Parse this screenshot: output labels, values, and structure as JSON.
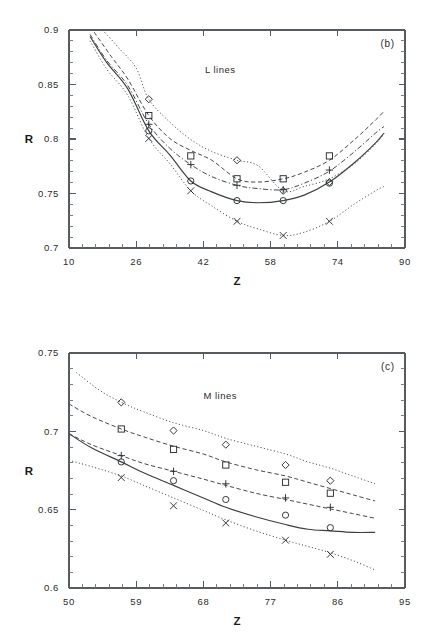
{
  "figure": {
    "background": "#ffffff",
    "ink_color": "#3a3f42"
  },
  "panels": [
    {
      "tag": "(b)",
      "annotation": "L lines",
      "xlabel": "Z",
      "ylabel": "R"
    },
    {
      "tag": "(c)",
      "annotation": "M lines",
      "xlabel": "Z",
      "ylabel": "R"
    }
  ],
  "chart_data": [
    {
      "type": "line",
      "title": "L lines",
      "panel_tag": "(b)",
      "xlabel": "Z",
      "ylabel": "R",
      "xlim": [
        10,
        90
      ],
      "ylim": [
        0.7,
        0.9
      ],
      "xticks": [
        10,
        26,
        42,
        58,
        74,
        90
      ],
      "xtick_labels": [
        "10",
        "26",
        "42",
        "58",
        "74",
        "90"
      ],
      "yticks": [
        0.7,
        0.75,
        0.8,
        0.85,
        0.9
      ],
      "ytick_labels": [
        "0.7",
        "0.75",
        "0.8",
        "0.85",
        "0.9"
      ],
      "x_minor_per_major": 4,
      "y_minor_per_major": 4,
      "grid": false,
      "legend": "none",
      "series": [
        {
          "name": "diamond-series",
          "marker": "diamond",
          "linestyle": "dotted",
          "x": [
            18,
            22,
            26,
            29,
            34,
            39,
            44,
            50,
            55,
            61,
            66,
            72,
            78,
            83,
            85
          ],
          "y": [
            0.9,
            0.883,
            0.865,
            0.8365,
            0.8155,
            0.7995,
            0.7885,
            0.7805,
            0.7755,
            0.7525,
            0.7565,
            0.7635,
            0.7775,
            0.7955,
            0.805
          ],
          "marker_x": [
            29,
            50,
            61,
            72
          ],
          "marker_y": [
            0.8365,
            0.7805,
            0.7525,
            0.7605
          ]
        },
        {
          "name": "square-series",
          "marker": "square",
          "linestyle": "dashed",
          "x": [
            16,
            20,
            24,
            29,
            34,
            39,
            44,
            50,
            55,
            61,
            66,
            72,
            78,
            83,
            85
          ],
          "y": [
            0.898,
            0.876,
            0.855,
            0.8215,
            0.8005,
            0.7895,
            0.7805,
            0.7635,
            0.7605,
            0.7635,
            0.7695,
            0.7805,
            0.7995,
            0.8175,
            0.8255
          ],
          "marker_x": [
            29,
            39,
            50,
            61,
            72
          ],
          "marker_y": [
            0.8215,
            0.7845,
            0.7635,
            0.7635,
            0.7845
          ]
        },
        {
          "name": "plus-series",
          "marker": "plus",
          "linestyle": "dashdot",
          "x": [
            15,
            19,
            24,
            29,
            34,
            39,
            44,
            50,
            55,
            61,
            66,
            72,
            78,
            83,
            85
          ],
          "y": [
            0.896,
            0.872,
            0.849,
            0.8135,
            0.7915,
            0.7765,
            0.7655,
            0.7575,
            0.7545,
            0.7535,
            0.7595,
            0.7705,
            0.7885,
            0.8055,
            0.8115
          ],
          "marker_x": [
            29,
            39,
            50,
            61,
            72
          ],
          "marker_y": [
            0.8135,
            0.7765,
            0.7575,
            0.7535,
            0.7715
          ]
        },
        {
          "name": "circle-series",
          "marker": "circle",
          "linestyle": "solid",
          "x": [
            15,
            19,
            24,
            29,
            34,
            39,
            44,
            50,
            55,
            61,
            66,
            72,
            78,
            83,
            85
          ],
          "y": [
            0.894,
            0.87,
            0.846,
            0.8075,
            0.7855,
            0.7615,
            0.7515,
            0.7435,
            0.7415,
            0.7435,
            0.7485,
            0.7605,
            0.7785,
            0.7965,
            0.8055
          ],
          "marker_x": [
            29,
            39,
            50,
            61,
            72
          ],
          "marker_y": [
            0.8075,
            0.7615,
            0.7435,
            0.7435,
            0.7595
          ]
        },
        {
          "name": "cross-series",
          "marker": "cross",
          "linestyle": "dotted",
          "x": [
            15,
            19,
            24,
            29,
            34,
            39,
            44,
            50,
            55,
            61,
            66,
            72,
            78,
            83,
            85
          ],
          "y": [
            0.89,
            0.864,
            0.84,
            0.8005,
            0.7775,
            0.7525,
            0.7385,
            0.7245,
            0.7175,
            0.7115,
            0.7145,
            0.7245,
            0.7405,
            0.7525,
            0.7565
          ],
          "marker_x": [
            29,
            39,
            50,
            61,
            72
          ],
          "marker_y": [
            0.8005,
            0.7525,
            0.7245,
            0.7115,
            0.7245
          ]
        }
      ]
    },
    {
      "type": "line",
      "title": "M lines",
      "panel_tag": "(c)",
      "xlabel": "Z",
      "ylabel": "R",
      "xlim": [
        50,
        95
      ],
      "ylim": [
        0.6,
        0.75
      ],
      "xticks": [
        50,
        59,
        68,
        77,
        86,
        95
      ],
      "xtick_labels": [
        "50",
        "59",
        "68",
        "77",
        "86",
        "95"
      ],
      "yticks": [
        0.6,
        0.65,
        0.7,
        0.75
      ],
      "ytick_labels": [
        "0.6",
        "0.65",
        "0.7",
        "0.75"
      ],
      "x_minor_per_major": 4,
      "y_minor_per_major": 4,
      "grid": false,
      "legend": "none",
      "series": [
        {
          "name": "diamond-series",
          "marker": "diamond",
          "linestyle": "dotted",
          "x": [
            51,
            54,
            57,
            60,
            64,
            68,
            71,
            75,
            79,
            82,
            85,
            88,
            91
          ],
          "y": [
            0.7375,
            0.7265,
            0.7185,
            0.7125,
            0.7055,
            0.7005,
            0.6955,
            0.6905,
            0.6855,
            0.6805,
            0.6765,
            0.6715,
            0.6665
          ],
          "marker_x": [
            57,
            64,
            71,
            79,
            85
          ],
          "marker_y": [
            0.7185,
            0.7005,
            0.6915,
            0.6785,
            0.6685
          ]
        },
        {
          "name": "square-series",
          "marker": "square",
          "linestyle": "dashed",
          "x": [
            50,
            53,
            57,
            60,
            64,
            68,
            71,
            75,
            79,
            82,
            85,
            88,
            91
          ],
          "y": [
            0.7175,
            0.7095,
            0.7015,
            0.6965,
            0.6905,
            0.6855,
            0.6805,
            0.6755,
            0.6715,
            0.6675,
            0.6635,
            0.6595,
            0.6555
          ],
          "marker_x": [
            57,
            64,
            71,
            79,
            85
          ],
          "marker_y": [
            0.7015,
            0.6885,
            0.6785,
            0.6675,
            0.6605
          ]
        },
        {
          "name": "plus-series",
          "marker": "plus",
          "linestyle": "dashed",
          "x": [
            50,
            53,
            57,
            60,
            64,
            68,
            71,
            75,
            79,
            82,
            85,
            88,
            91
          ],
          "y": [
            0.6985,
            0.6915,
            0.6845,
            0.6795,
            0.6745,
            0.6695,
            0.6655,
            0.6605,
            0.6565,
            0.6535,
            0.6505,
            0.6475,
            0.6445
          ],
          "marker_x": [
            57,
            64,
            71,
            79,
            85
          ],
          "marker_y": [
            0.6845,
            0.6745,
            0.6665,
            0.6575,
            0.6515
          ]
        },
        {
          "name": "circle-series",
          "marker": "circle",
          "linestyle": "solid",
          "x": [
            50,
            53,
            57,
            60,
            64,
            68,
            71,
            75,
            79,
            82,
            85,
            88,
            91
          ],
          "y": [
            0.6985,
            0.6895,
            0.6805,
            0.6735,
            0.6655,
            0.6575,
            0.6515,
            0.6455,
            0.6405,
            0.6375,
            0.6365,
            0.6355,
            0.6355
          ],
          "marker_x": [
            57,
            64,
            71,
            79,
            85
          ],
          "marker_y": [
            0.6805,
            0.6685,
            0.6565,
            0.6465,
            0.6385
          ]
        },
        {
          "name": "cross-series",
          "marker": "cross",
          "linestyle": "dotted",
          "x": [
            50,
            53,
            57,
            60,
            64,
            68,
            71,
            75,
            79,
            82,
            85,
            88,
            91
          ],
          "y": [
            0.6815,
            0.6775,
            0.6715,
            0.6655,
            0.6575,
            0.6495,
            0.6435,
            0.6365,
            0.6305,
            0.6265,
            0.6225,
            0.6175,
            0.6115
          ],
          "marker_x": [
            57,
            64,
            71,
            79,
            85
          ],
          "marker_y": [
            0.6705,
            0.6525,
            0.6415,
            0.6305,
            0.6215
          ]
        }
      ]
    }
  ]
}
